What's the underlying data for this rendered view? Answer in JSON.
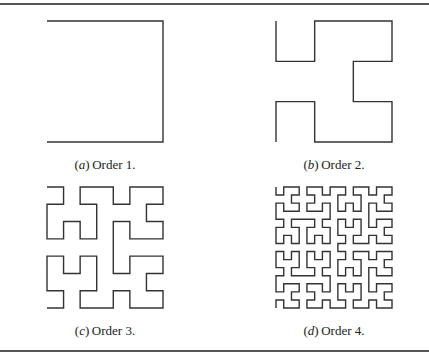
{
  "figure": {
    "line_color": "#333333",
    "rule_color": "#555555",
    "panels": [
      {
        "id": "a",
        "label": "a",
        "text": "Order 1.",
        "order": 1
      },
      {
        "id": "b",
        "label": "b",
        "text": "Order 2.",
        "order": 2
      },
      {
        "id": "c",
        "label": "c",
        "text": "Order 3.",
        "order": 3
      },
      {
        "id": "d",
        "label": "d",
        "text": "Order 4.",
        "order": 4
      }
    ]
  }
}
